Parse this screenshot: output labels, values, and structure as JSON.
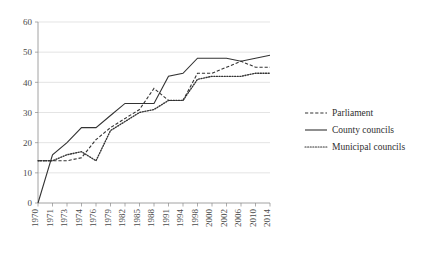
{
  "chart_data": {
    "type": "line",
    "title": "",
    "subtitle": "",
    "xlabel": "",
    "ylabel": "",
    "ylim": [
      0,
      60
    ],
    "yticks": [
      0,
      10,
      20,
      30,
      40,
      50,
      60
    ],
    "grid": true,
    "legend_position": "right",
    "categories": [
      "1970",
      "1971",
      "1973",
      "1974",
      "1976",
      "1979",
      "1982",
      "1985",
      "1988",
      "1991",
      "1994",
      "1998",
      "2000",
      "2002",
      "2006",
      "2010",
      "2014"
    ],
    "series": [
      {
        "name": "Parliament",
        "style": "dashed",
        "values": [
          14,
          14,
          14,
          15,
          21,
          25,
          28,
          31,
          38,
          34,
          34,
          43,
          43,
          45,
          47,
          45,
          45
        ]
      },
      {
        "name": "County councils",
        "style": "solid",
        "values": [
          0,
          16,
          20,
          25,
          25,
          29,
          33,
          33,
          33,
          42,
          43,
          48,
          48,
          48,
          47,
          48,
          49
        ]
      },
      {
        "name": "Municipal councils",
        "style": "dotted",
        "values": [
          14,
          14,
          16,
          17,
          14,
          24,
          27,
          30,
          31,
          34,
          34,
          41,
          42,
          42,
          42,
          43,
          43
        ]
      }
    ]
  },
  "legend": {
    "items": [
      {
        "label": "Parliament"
      },
      {
        "label": "County councils"
      },
      {
        "label": "Municipal councils"
      }
    ]
  },
  "colors": {
    "line": "#333333",
    "grid": "#d9d9d9",
    "axis": "#8a8a8a",
    "text": "#3a3a3a",
    "background": "#ffffff"
  }
}
